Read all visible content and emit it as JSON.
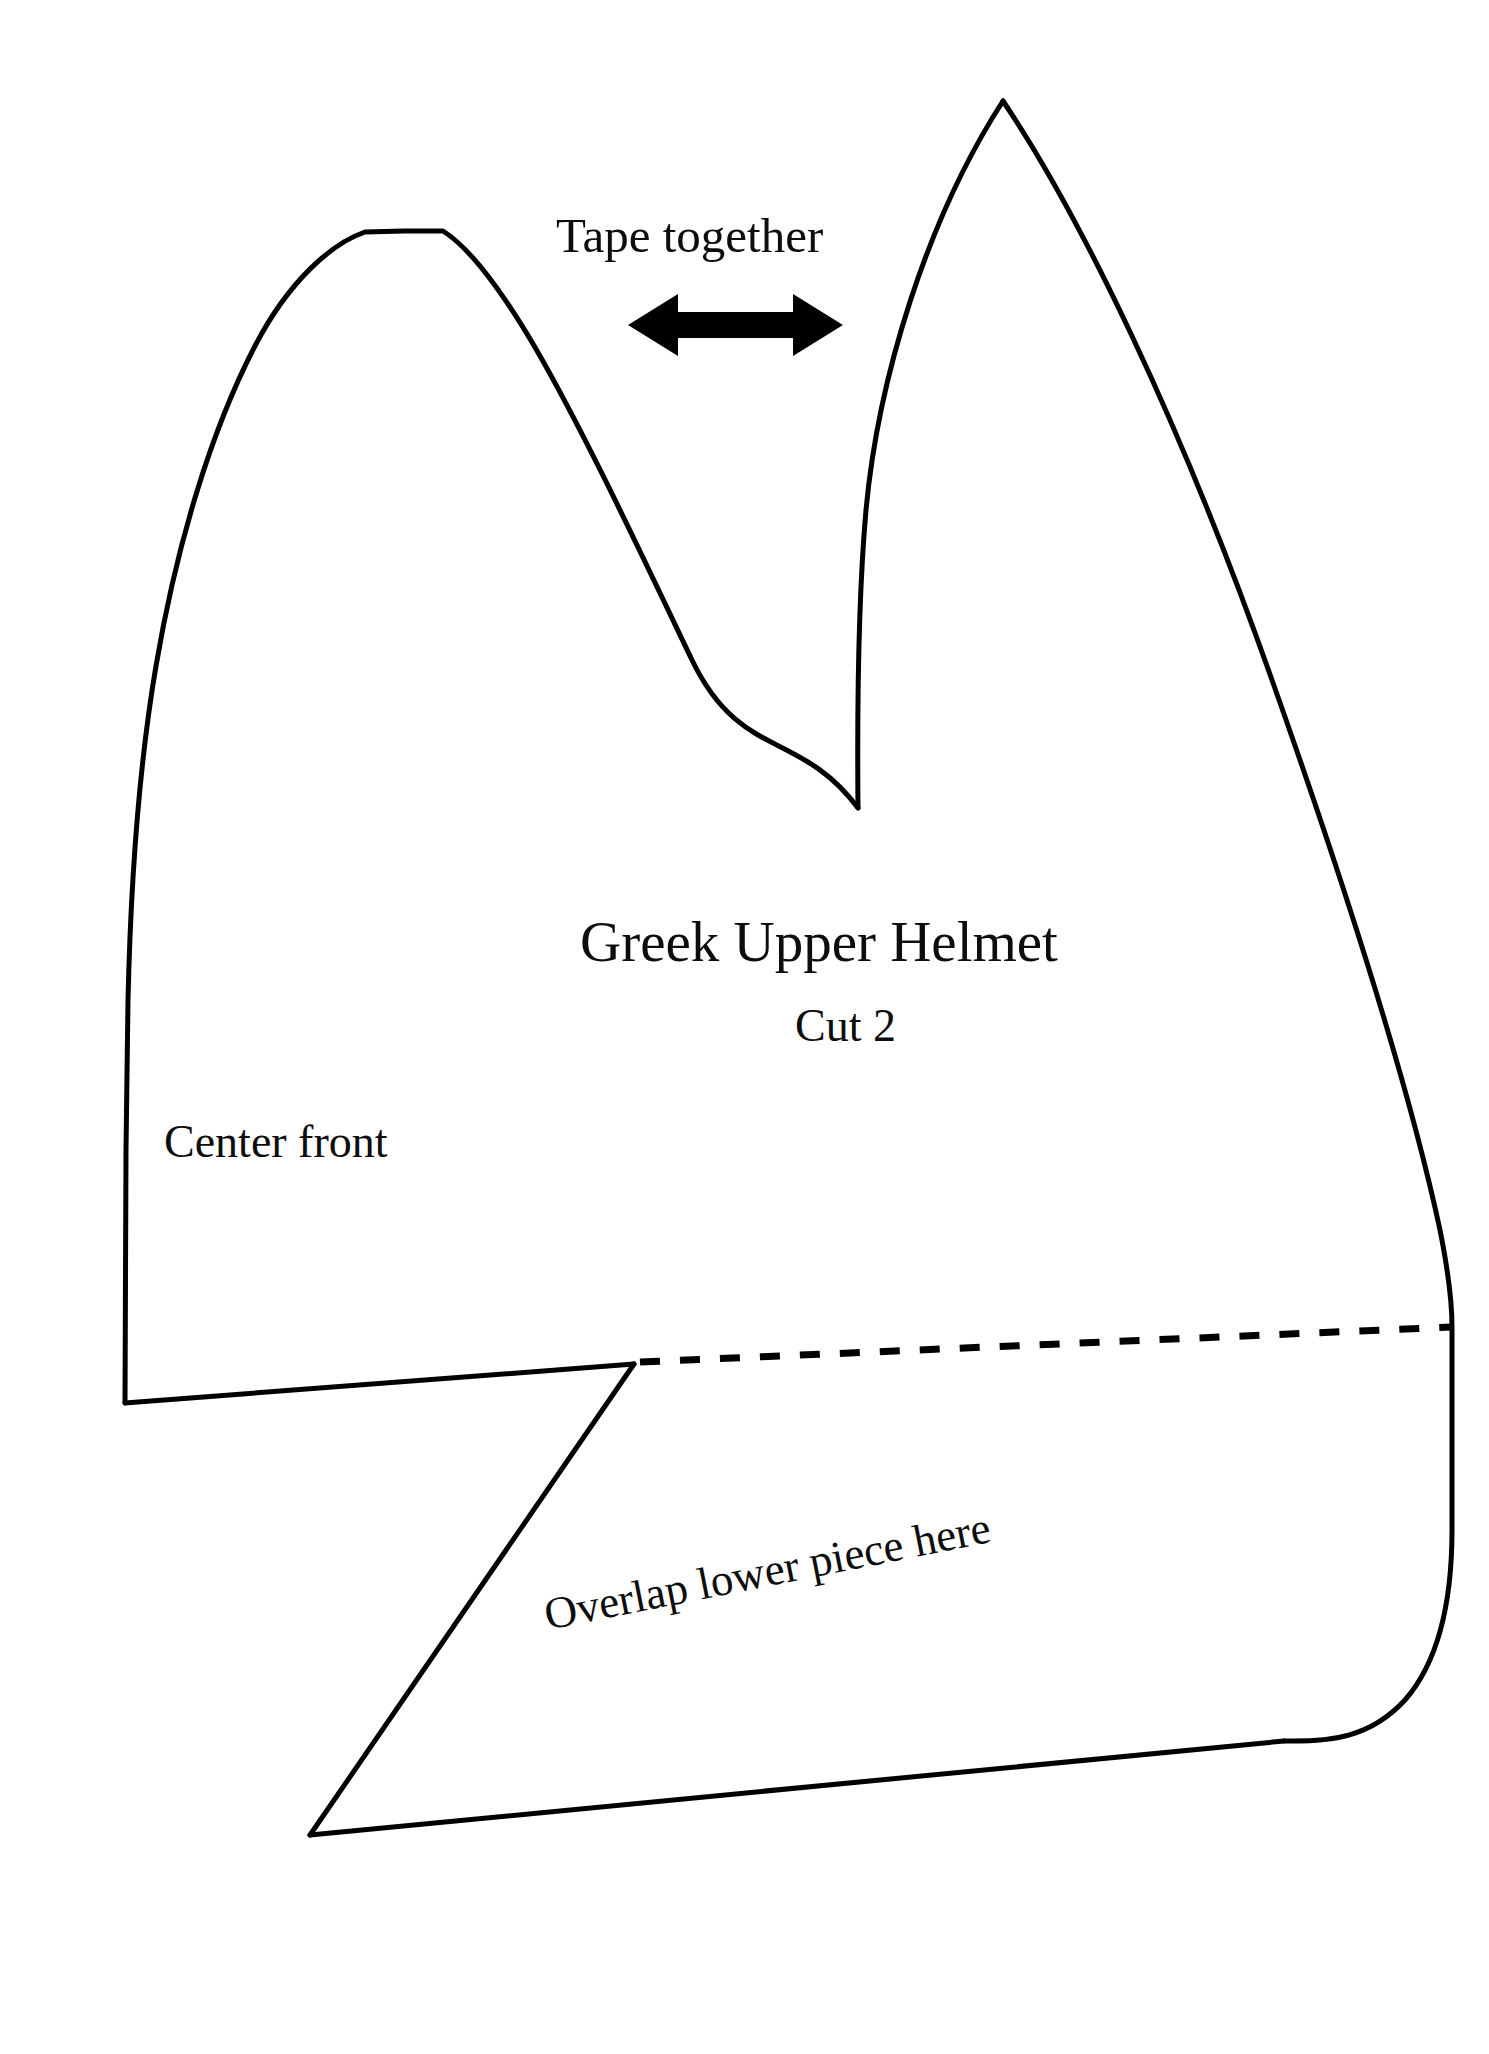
{
  "document": {
    "kind": "sewing-pattern-template",
    "background_color": "#ffffff",
    "ink_color": "#000000"
  },
  "labels": {
    "tape_together": "Tape together",
    "title": "Greek Upper Helmet",
    "cut_count": "Cut 2",
    "center_front": "Center front",
    "overlap_note": "Overlap lower piece here"
  },
  "icons": {
    "double_arrow": "double-headed-horizontal-arrow"
  },
  "pattern": {
    "outline_color": "#000000",
    "outline_width": 5,
    "fold_line_style": "dashed",
    "fold_line_width": 6,
    "fold_line_dash": "22 18",
    "left_peak_apex": [
      404,
      231
    ],
    "right_peak_apex": [
      1003,
      101
    ],
    "notch_bottom": [
      858,
      808
    ],
    "bottom_left_corner": [
      125,
      1403
    ],
    "bottom_tail_point": [
      310,
      1835
    ],
    "dash_start": [
      634,
      1362
    ],
    "dash_end": [
      1452,
      1327
    ]
  }
}
